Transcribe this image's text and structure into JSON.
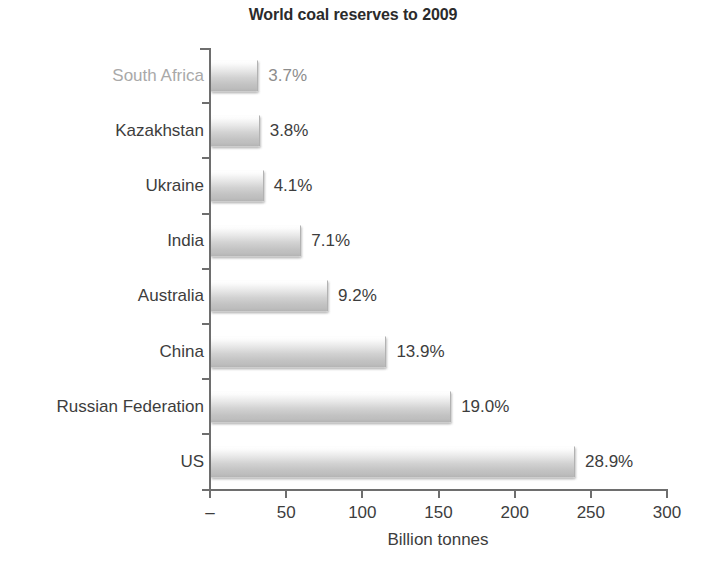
{
  "chart_data": {
    "type": "bar",
    "orientation": "horizontal",
    "title": "World coal reserves to 2009",
    "xlabel": "Billion tonnes",
    "ylabel": "",
    "xlim": [
      0,
      300
    ],
    "xticks": [
      0,
      50,
      100,
      150,
      200,
      250,
      300
    ],
    "xtick_labels": [
      "–",
      "50",
      "100",
      "150",
      "200",
      "250",
      "300"
    ],
    "grid": false,
    "legend": null,
    "categories": [
      "South Africa",
      "Kazakhstan",
      "Ukraine",
      "India",
      "Australia",
      "China",
      "Russian Federation",
      "US"
    ],
    "values": [
      30.4,
      31.3,
      33.9,
      58.6,
      76.2,
      114.5,
      157.0,
      238.3
    ],
    "data_labels": [
      "3.7%",
      "3.8%",
      "4.1%",
      "7.1%",
      "9.2%",
      "13.9%",
      "19.0%",
      "28.9%"
    ],
    "percent_values": [
      3.7,
      3.8,
      4.1,
      7.1,
      9.2,
      13.9,
      19.0,
      28.9
    ]
  },
  "style": {
    "bar_fill_light": "#ffffff",
    "bar_fill_dark": "#b9b9b9",
    "axis_color": "#6e6e6e",
    "text_color": "#3d3d3d",
    "title_color": "#2b2b2b",
    "background": "#ffffff"
  }
}
